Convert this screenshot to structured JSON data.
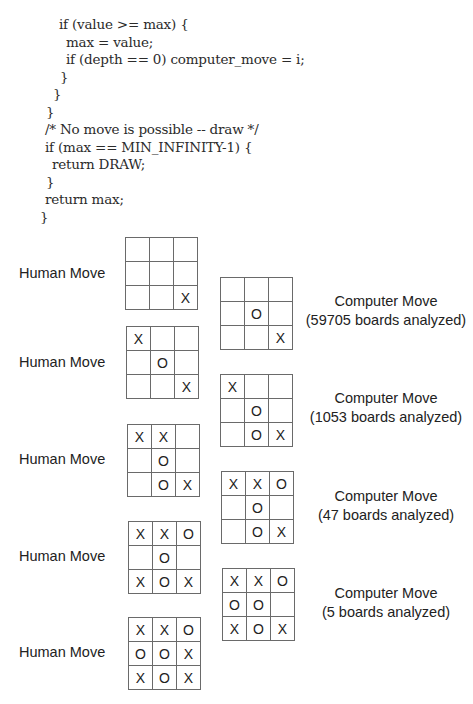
{
  "code": {
    "lines": [
      "if (value >= max) {",
      "max = value;",
      "if (depth == 0) computer_move = i;",
      "}",
      "}",
      "}",
      "/* No move is possible -- draw */",
      "if (max == MIN_INFINITY-1) {",
      "return DRAW;",
      "}",
      "return max;",
      "}"
    ]
  },
  "figure": {
    "human_label": "Human Move",
    "computer_label": "Computer Move",
    "human_moves": [
      {
        "label": "Human Move",
        "board": [
          "",
          "",
          "",
          "",
          "",
          "",
          "",
          "",
          "X"
        ]
      },
      {
        "label": "Human Move",
        "board": [
          "X",
          "",
          "",
          "",
          "O",
          "",
          "",
          "",
          "X"
        ]
      },
      {
        "label": "Human Move",
        "board": [
          "X",
          "X",
          "",
          "",
          "O",
          "",
          "",
          "O",
          "X"
        ]
      },
      {
        "label": "Human Move",
        "board": [
          "X",
          "X",
          "O",
          "",
          "O",
          "",
          "X",
          "O",
          "X"
        ]
      },
      {
        "label": "Human Move",
        "board": [
          "X",
          "X",
          "O",
          "O",
          "O",
          "X",
          "X",
          "O",
          "X"
        ]
      }
    ],
    "computer_moves": [
      {
        "label": "Computer Move",
        "analysis": "(59705 boards analyzed)",
        "board": [
          "",
          "",
          "",
          "",
          "O",
          "",
          "",
          "",
          "X"
        ]
      },
      {
        "label": "Computer Move",
        "analysis": "(1053 boards analyzed)",
        "board": [
          "X",
          "",
          "",
          "",
          "O",
          "",
          "",
          "O",
          "X"
        ]
      },
      {
        "label": "Computer Move",
        "analysis": "(47 boards analyzed)",
        "board": [
          "X",
          "X",
          "O",
          "",
          "O",
          "",
          "",
          "O",
          "X"
        ]
      },
      {
        "label": "Computer Move",
        "analysis": "(5 boards analyzed)",
        "board": [
          "X",
          "X",
          "O",
          "O",
          "O",
          "",
          "X",
          "O",
          "X"
        ]
      }
    ]
  },
  "footer": {
    "cut_text": "Figure caption text (cut off)"
  }
}
